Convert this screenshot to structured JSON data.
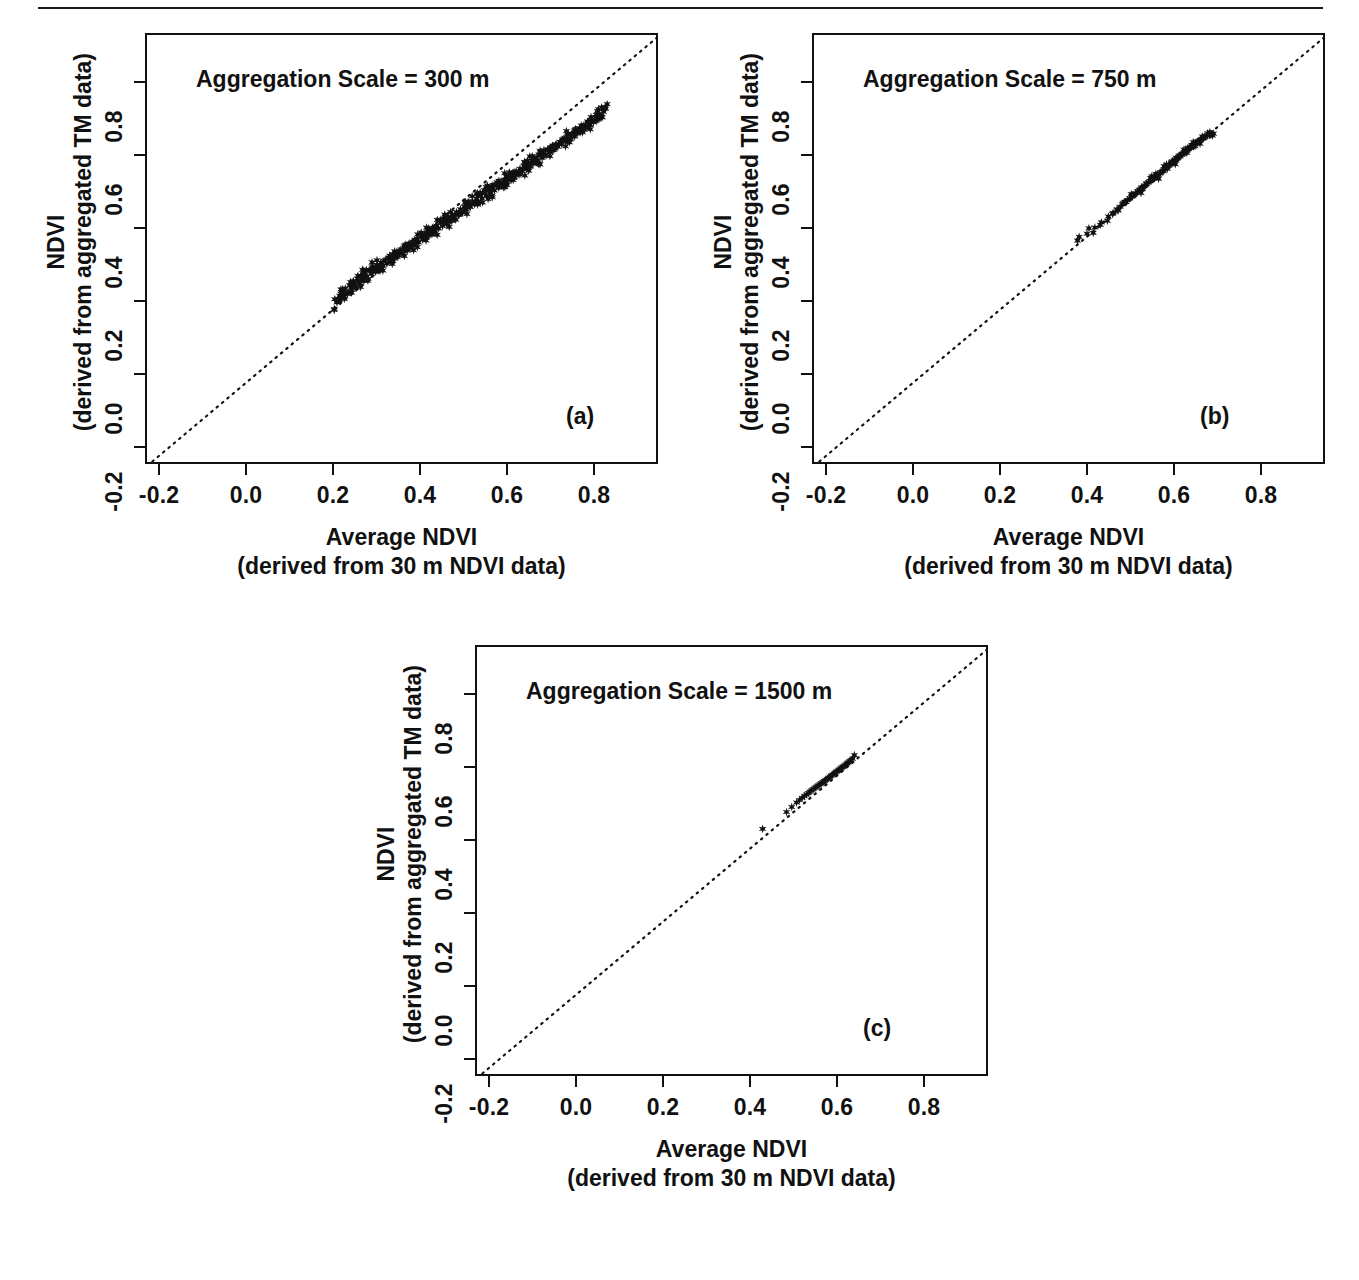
{
  "figure": {
    "rule_present": true,
    "marker_color": "#111111",
    "line_color": "#111111",
    "axis_color": "#111111"
  },
  "axes_common": {
    "ytitle_line1": "NDVI",
    "ytitle_line2": "(derived from aggregated TM data)",
    "xtitle_line1": "Average NDVI",
    "xtitle_line2": "(derived from 30 m NDVI data)",
    "xticks": [
      "-0.2",
      "0.0",
      "0.2",
      "0.4",
      "0.6",
      "0.8"
    ],
    "yticks": [
      "-0.2",
      "0.0",
      "0.2",
      "0.4",
      "0.6",
      "0.8"
    ],
    "xtick_values": [
      -0.2,
      0.0,
      0.2,
      0.4,
      0.6,
      0.8
    ],
    "ytick_values": [
      -0.2,
      0.0,
      0.2,
      0.4,
      0.6,
      0.8
    ]
  },
  "panels": [
    {
      "id": "a",
      "letter": "(a)",
      "annotation": "Aggregation Scale = 300 m"
    },
    {
      "id": "b",
      "letter": "(b)",
      "annotation": "Aggregation Scale = 750 m"
    },
    {
      "id": "c",
      "letter": "(c)",
      "annotation": "Aggregation Scale = 1500 m"
    }
  ],
  "chart_data": [
    {
      "type": "scatter",
      "panel": "a",
      "title": "Aggregation Scale = 300 m",
      "xlabel": "Average NDVI (derived from 30 m NDVI data)",
      "ylabel": "NDVI (derived from aggregated TM data)",
      "xlim": [
        -0.28,
        0.9
      ],
      "ylim": [
        -0.28,
        0.9
      ],
      "grid": false,
      "legend": "none",
      "reference_line": {
        "type": "1:1",
        "style": "dotted",
        "slope": 1,
        "intercept": 0
      },
      "marker": "star",
      "n_points": 420,
      "x_range_observed": [
        0.155,
        0.775
      ],
      "y_range_observed": [
        0.165,
        0.775
      ],
      "points": [
        [
          0.157,
          0.168
        ],
        [
          0.16,
          0.178
        ],
        [
          0.163,
          0.186
        ],
        [
          0.168,
          0.182
        ],
        [
          0.172,
          0.196
        ],
        [
          0.176,
          0.206
        ],
        [
          0.181,
          0.191
        ],
        [
          0.186,
          0.215
        ],
        [
          0.19,
          0.203
        ],
        [
          0.195,
          0.224
        ],
        [
          0.199,
          0.212
        ],
        [
          0.204,
          0.233
        ],
        [
          0.208,
          0.221
        ],
        [
          0.213,
          0.241
        ],
        [
          0.217,
          0.23
        ],
        [
          0.222,
          0.249
        ],
        [
          0.226,
          0.238
        ],
        [
          0.231,
          0.257
        ],
        [
          0.236,
          0.246
        ],
        [
          0.24,
          0.263
        ],
        [
          0.245,
          0.252
        ],
        [
          0.249,
          0.271
        ],
        [
          0.254,
          0.259
        ],
        [
          0.258,
          0.277
        ],
        [
          0.263,
          0.268
        ],
        [
          0.268,
          0.284
        ],
        [
          0.272,
          0.274
        ],
        [
          0.277,
          0.291
        ],
        [
          0.281,
          0.281
        ],
        [
          0.286,
          0.299
        ],
        [
          0.29,
          0.288
        ],
        [
          0.295,
          0.305
        ],
        [
          0.299,
          0.296
        ],
        [
          0.304,
          0.313
        ],
        [
          0.309,
          0.302
        ],
        [
          0.313,
          0.32
        ],
        [
          0.318,
          0.31
        ],
        [
          0.322,
          0.327
        ],
        [
          0.327,
          0.317
        ],
        [
          0.331,
          0.334
        ],
        [
          0.336,
          0.325
        ],
        [
          0.341,
          0.342
        ],
        [
          0.345,
          0.332
        ],
        [
          0.35,
          0.349
        ],
        [
          0.354,
          0.34
        ],
        [
          0.359,
          0.356
        ],
        [
          0.363,
          0.347
        ],
        [
          0.368,
          0.364
        ],
        [
          0.373,
          0.355
        ],
        [
          0.377,
          0.371
        ],
        [
          0.382,
          0.362
        ],
        [
          0.386,
          0.378
        ],
        [
          0.391,
          0.37
        ],
        [
          0.395,
          0.386
        ],
        [
          0.4,
          0.377
        ],
        [
          0.405,
          0.393
        ],
        [
          0.409,
          0.385
        ],
        [
          0.414,
          0.401
        ],
        [
          0.418,
          0.392
        ],
        [
          0.423,
          0.408
        ],
        [
          0.427,
          0.4
        ],
        [
          0.432,
          0.415
        ],
        [
          0.437,
          0.407
        ],
        [
          0.441,
          0.423
        ],
        [
          0.446,
          0.414
        ],
        [
          0.45,
          0.43
        ],
        [
          0.455,
          0.422
        ],
        [
          0.459,
          0.437
        ],
        [
          0.464,
          0.429
        ],
        [
          0.469,
          0.445
        ],
        [
          0.473,
          0.437
        ],
        [
          0.478,
          0.452
        ],
        [
          0.482,
          0.444
        ],
        [
          0.487,
          0.46
        ],
        [
          0.491,
          0.452
        ],
        [
          0.496,
          0.467
        ],
        [
          0.501,
          0.459
        ],
        [
          0.505,
          0.475
        ],
        [
          0.51,
          0.467
        ],
        [
          0.514,
          0.482
        ],
        [
          0.519,
          0.474
        ],
        [
          0.523,
          0.489
        ],
        [
          0.528,
          0.482
        ],
        [
          0.533,
          0.497
        ],
        [
          0.537,
          0.489
        ],
        [
          0.542,
          0.504
        ],
        [
          0.546,
          0.497
        ],
        [
          0.551,
          0.512
        ],
        [
          0.555,
          0.504
        ],
        [
          0.56,
          0.519
        ],
        [
          0.565,
          0.512
        ],
        [
          0.569,
          0.527
        ],
        [
          0.574,
          0.519
        ],
        [
          0.578,
          0.534
        ],
        [
          0.583,
          0.527
        ],
        [
          0.587,
          0.541
        ],
        [
          0.592,
          0.534
        ],
        [
          0.597,
          0.549
        ],
        [
          0.601,
          0.542
        ],
        [
          0.606,
          0.556
        ],
        [
          0.61,
          0.549
        ],
        [
          0.615,
          0.564
        ],
        [
          0.619,
          0.556
        ],
        [
          0.624,
          0.571
        ],
        [
          0.629,
          0.564
        ],
        [
          0.633,
          0.578
        ],
        [
          0.638,
          0.571
        ],
        [
          0.642,
          0.586
        ],
        [
          0.647,
          0.579
        ],
        [
          0.651,
          0.593
        ],
        [
          0.656,
          0.586
        ],
        [
          0.661,
          0.601
        ],
        [
          0.665,
          0.594
        ],
        [
          0.67,
          0.608
        ],
        [
          0.674,
          0.601
        ],
        [
          0.679,
          0.616
        ],
        [
          0.683,
          0.609
        ],
        [
          0.688,
          0.623
        ],
        [
          0.693,
          0.616
        ],
        [
          0.697,
          0.63
        ],
        [
          0.702,
          0.624
        ],
        [
          0.706,
          0.638
        ],
        [
          0.711,
          0.631
        ],
        [
          0.715,
          0.645
        ],
        [
          0.72,
          0.639
        ],
        [
          0.725,
          0.653
        ],
        [
          0.729,
          0.646
        ],
        [
          0.734,
          0.66
        ],
        [
          0.738,
          0.654
        ],
        [
          0.743,
          0.668
        ],
        [
          0.747,
          0.661
        ],
        [
          0.752,
          0.675
        ],
        [
          0.757,
          0.669
        ],
        [
          0.761,
          0.683
        ],
        [
          0.766,
          0.676
        ],
        [
          0.77,
          0.69
        ],
        [
          0.775,
          0.698
        ]
      ],
      "scatter_description": "Dense elongated cloud hugging the 1:1 line from about (0.16,0.17) to (0.78,0.78); spread widest near NDVI 0.40-0.60 with several points sitting above the line."
    },
    {
      "type": "scatter",
      "panel": "b",
      "title": "Aggregation Scale = 750 m",
      "xlabel": "Average NDVI (derived from 30 m NDVI data)",
      "ylabel": "NDVI (derived from aggregated TM data)",
      "xlim": [
        -0.28,
        0.9
      ],
      "ylim": [
        -0.28,
        0.9
      ],
      "grid": false,
      "legend": "none",
      "reference_line": {
        "type": "1:1",
        "style": "dotted",
        "slope": 1,
        "intercept": 0
      },
      "marker": "star",
      "n_points": 150,
      "x_range_observed": [
        0.325,
        0.64
      ],
      "y_range_observed": [
        0.335,
        0.63
      ],
      "points": [
        [
          0.326,
          0.337
        ],
        [
          0.348,
          0.356
        ],
        [
          0.366,
          0.373
        ],
        [
          0.381,
          0.387
        ],
        [
          0.397,
          0.403
        ],
        [
          0.408,
          0.413
        ],
        [
          0.417,
          0.423
        ],
        [
          0.424,
          0.43
        ],
        [
          0.43,
          0.437
        ],
        [
          0.436,
          0.443
        ],
        [
          0.441,
          0.448
        ],
        [
          0.446,
          0.453
        ],
        [
          0.451,
          0.458
        ],
        [
          0.456,
          0.463
        ],
        [
          0.46,
          0.467
        ],
        [
          0.465,
          0.471
        ],
        [
          0.469,
          0.476
        ],
        [
          0.473,
          0.48
        ],
        [
          0.477,
          0.484
        ],
        [
          0.481,
          0.488
        ],
        [
          0.485,
          0.492
        ],
        [
          0.489,
          0.496
        ],
        [
          0.493,
          0.5
        ],
        [
          0.497,
          0.503
        ],
        [
          0.5,
          0.507
        ],
        [
          0.504,
          0.511
        ],
        [
          0.508,
          0.514
        ],
        [
          0.511,
          0.518
        ],
        [
          0.515,
          0.521
        ],
        [
          0.518,
          0.525
        ],
        [
          0.522,
          0.528
        ],
        [
          0.525,
          0.532
        ],
        [
          0.529,
          0.535
        ],
        [
          0.532,
          0.539
        ],
        [
          0.535,
          0.542
        ],
        [
          0.539,
          0.545
        ],
        [
          0.542,
          0.549
        ],
        [
          0.545,
          0.552
        ],
        [
          0.549,
          0.555
        ],
        [
          0.552,
          0.559
        ],
        [
          0.555,
          0.562
        ],
        [
          0.558,
          0.565
        ],
        [
          0.562,
          0.568
        ],
        [
          0.565,
          0.572
        ],
        [
          0.568,
          0.575
        ],
        [
          0.571,
          0.578
        ],
        [
          0.575,
          0.581
        ],
        [
          0.578,
          0.584
        ],
        [
          0.581,
          0.588
        ],
        [
          0.584,
          0.591
        ],
        [
          0.588,
          0.594
        ],
        [
          0.591,
          0.597
        ],
        [
          0.594,
          0.6
        ],
        [
          0.598,
          0.603
        ],
        [
          0.601,
          0.606
        ],
        [
          0.605,
          0.609
        ],
        [
          0.608,
          0.612
        ],
        [
          0.612,
          0.615
        ],
        [
          0.616,
          0.618
        ],
        [
          0.62,
          0.621
        ],
        [
          0.625,
          0.624
        ],
        [
          0.63,
          0.626
        ],
        [
          0.635,
          0.628
        ],
        [
          0.639,
          0.63
        ]
      ],
      "scatter_description": "Tight cluster along the 1:1 line from roughly (0.33,0.34) up to (0.64,0.63), with a few isolated points at the low end near 0.33-0.40."
    },
    {
      "type": "scatter",
      "panel": "c",
      "title": "Aggregation Scale = 1500 m",
      "xlabel": "Average NDVI (derived from 30 m NDVI data)",
      "ylabel": "NDVI (derived from aggregated TM data)",
      "xlim": [
        -0.28,
        0.9
      ],
      "ylim": [
        -0.28,
        0.9
      ],
      "grid": false,
      "legend": "none",
      "reference_line": {
        "type": "1:1",
        "style": "dotted",
        "slope": 1,
        "intercept": 0
      },
      "marker": "star",
      "n_points": 60,
      "x_range_observed": [
        0.375,
        0.59
      ],
      "y_range_observed": [
        0.4,
        0.605
      ],
      "points": [
        [
          0.377,
          0.402
        ],
        [
          0.432,
          0.448
        ],
        [
          0.444,
          0.462
        ],
        [
          0.455,
          0.474
        ],
        [
          0.462,
          0.481
        ],
        [
          0.468,
          0.487
        ],
        [
          0.473,
          0.492
        ],
        [
          0.478,
          0.496
        ],
        [
          0.482,
          0.5
        ],
        [
          0.486,
          0.504
        ],
        [
          0.49,
          0.508
        ],
        [
          0.494,
          0.511
        ],
        [
          0.498,
          0.515
        ],
        [
          0.502,
          0.518
        ],
        [
          0.505,
          0.521
        ],
        [
          0.509,
          0.524
        ],
        [
          0.512,
          0.527
        ],
        [
          0.516,
          0.53
        ],
        [
          0.519,
          0.533
        ],
        [
          0.522,
          0.536
        ],
        [
          0.526,
          0.539
        ],
        [
          0.529,
          0.542
        ],
        [
          0.532,
          0.545
        ],
        [
          0.535,
          0.548
        ],
        [
          0.538,
          0.55
        ],
        [
          0.541,
          0.553
        ],
        [
          0.544,
          0.556
        ],
        [
          0.547,
          0.559
        ],
        [
          0.55,
          0.561
        ],
        [
          0.553,
          0.564
        ],
        [
          0.556,
          0.567
        ],
        [
          0.559,
          0.57
        ],
        [
          0.562,
          0.572
        ],
        [
          0.565,
          0.575
        ],
        [
          0.568,
          0.578
        ],
        [
          0.571,
          0.581
        ],
        [
          0.574,
          0.584
        ],
        [
          0.577,
          0.587
        ],
        [
          0.58,
          0.59
        ],
        [
          0.584,
          0.594
        ],
        [
          0.588,
          0.604
        ]
      ],
      "scatter_description": "Short compact cluster along the 1:1 line between about (0.43,0.45) and (0.59,0.60), plus one low outlier near (0.38,0.40)."
    }
  ]
}
